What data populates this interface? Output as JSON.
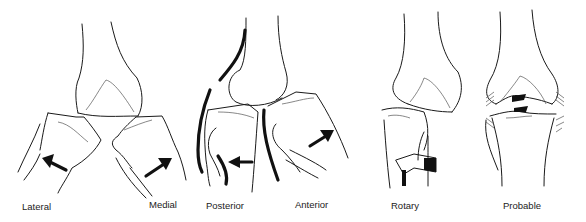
{
  "figure": {
    "panels": [
      {
        "id": "lateral",
        "label": "Lateral"
      },
      {
        "id": "medial",
        "label": "Medial"
      },
      {
        "id": "posterior",
        "label": "Posterior"
      },
      {
        "id": "anterior",
        "label": "Anterior"
      },
      {
        "id": "rotary",
        "label": "Rotary"
      },
      {
        "id": "probable",
        "label": "Probable"
      }
    ]
  }
}
